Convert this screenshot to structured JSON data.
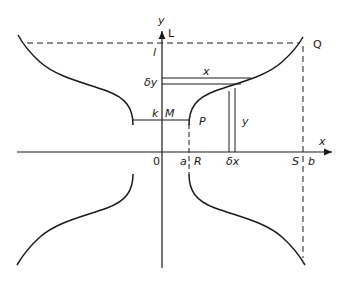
{
  "figure": {
    "type": "diagram",
    "colors": {
      "line": "#1a1a1a",
      "background": "#ffffff"
    },
    "axis_labels": {
      "x": "x",
      "y": "y",
      "L": "L"
    },
    "point_labels": {
      "origin": "0",
      "l": "l",
      "k": "k",
      "M": "M",
      "P": "P",
      "Q": "Q",
      "a": "a",
      "R": "R",
      "S": "S",
      "b": "b"
    },
    "element_labels": {
      "delta_y": "δy",
      "delta_x": "δx",
      "strip_x": "x",
      "strip_y": "y"
    }
  }
}
